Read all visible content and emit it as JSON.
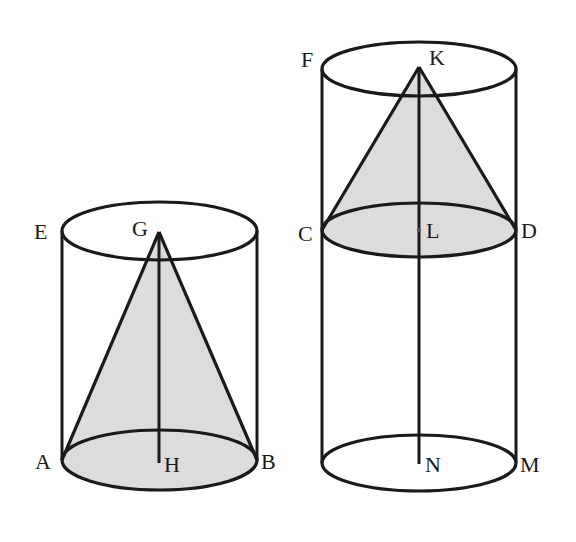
{
  "figure": {
    "colors": {
      "line": "#1a1a1a",
      "shade": "#dcdcdc",
      "background": "#ffffff"
    },
    "left_cylinder": {
      "labels": {
        "top_left": "E",
        "apex": "G",
        "base_left": "A",
        "base_center": "H",
        "base_right": "B"
      }
    },
    "right_cylinder": {
      "labels": {
        "top_left": "F",
        "apex": "K",
        "mid_left": "C",
        "mid_center": "L",
        "mid_right": "D",
        "base_center": "N",
        "base_right": "M"
      }
    }
  }
}
